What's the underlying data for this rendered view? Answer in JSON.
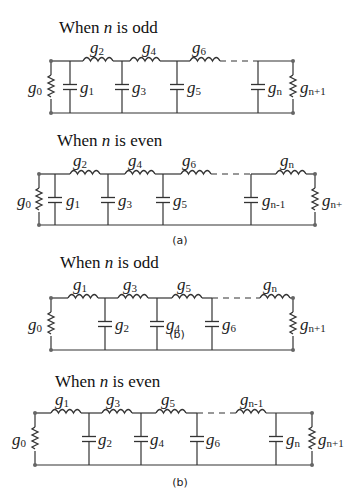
{
  "figure": {
    "a": {
      "caption": "(a)",
      "odd": {
        "title_pre": "When ",
        "title_var": "n",
        "title_post": " is odd",
        "source": "g0",
        "load": "gn+1",
        "series_inductors": [
          "g2",
          "g4",
          "g6"
        ],
        "shunt_capacitors": [
          "g1",
          "g3",
          "g5",
          "gn"
        ]
      },
      "even": {
        "title_pre": "When ",
        "title_var": "n",
        "title_post": " is even",
        "source": "g0",
        "load": "gn+1",
        "series_inductors": [
          "g2",
          "g4",
          "g6",
          "gn"
        ],
        "shunt_capacitors": [
          "g1",
          "g3",
          "g5",
          "gn-1"
        ]
      }
    },
    "b": {
      "caption": "(b)",
      "stray_caption": "(b)",
      "odd": {
        "title_pre": "When ",
        "title_var": "n",
        "title_post": " is odd",
        "source": "g0",
        "load": "gn+1",
        "series_inductors": [
          "g1",
          "g3",
          "g5",
          "gn"
        ],
        "shunt_capacitors": [
          "g2",
          "g4",
          "g6"
        ]
      },
      "even": {
        "title_pre": "When ",
        "title_var": "n",
        "title_post": " is even",
        "source": "g0",
        "load": "gn+1",
        "series_inductors": [
          "g1",
          "g3",
          "g5",
          "gn-1"
        ],
        "shunt_capacitors": [
          "g2",
          "g4",
          "g6",
          "gn"
        ]
      }
    }
  },
  "labels": {
    "g": "g",
    "0": "0",
    "1": "1",
    "2": "2",
    "3": "3",
    "4": "4",
    "5": "5",
    "6": "6",
    "n": "n",
    "n_minus_1": "n-1",
    "n_plus_1": "n+1",
    "n_plus_trunc": "n+"
  }
}
